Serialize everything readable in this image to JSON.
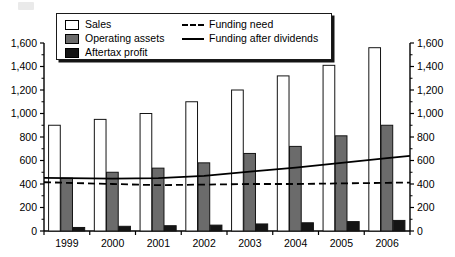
{
  "chart_data": {
    "type": "bar",
    "title": "",
    "xlabel": "",
    "ylabel": "",
    "ylim": [
      0,
      1600
    ],
    "y_ticks": [
      0,
      200,
      400,
      600,
      800,
      1000,
      1200,
      1400,
      1600
    ],
    "y_tick_labels": [
      "0",
      "200",
      "400",
      "600",
      "800",
      "1,000",
      "1,200",
      "1,400",
      "1,600"
    ],
    "dual_axis": true,
    "right_axis_same_as_left": true,
    "grid": false,
    "legend_position": "top-center",
    "categories": [
      "1999",
      "2000",
      "2001",
      "2002",
      "2003",
      "2004",
      "2005",
      "2006"
    ],
    "series": [
      {
        "name": "Sales",
        "kind": "bar",
        "color": "#ffffff",
        "values": [
          900,
          950,
          1000,
          1100,
          1200,
          1320,
          1410,
          1560
        ]
      },
      {
        "name": "Operating assets",
        "kind": "bar",
        "color": "#6b6b6b",
        "values": [
          450,
          500,
          535,
          580,
          660,
          720,
          810,
          900
        ]
      },
      {
        "name": "Aftertax profit",
        "kind": "bar",
        "color": "#141414",
        "values": [
          30,
          40,
          45,
          50,
          60,
          70,
          80,
          90
        ]
      },
      {
        "name": "Funding need",
        "kind": "line",
        "style": "dashed",
        "color": "#000000",
        "values": [
          410,
          400,
          390,
          395,
          400,
          400,
          405,
          410
        ]
      },
      {
        "name": "Funding after dividends",
        "kind": "line",
        "style": "solid",
        "color": "#000000",
        "values": [
          450,
          445,
          450,
          470,
          505,
          540,
          580,
          620
        ]
      }
    ]
  },
  "legend": {
    "items_bars": [
      {
        "label": "Sales",
        "swatch": "swatch-sales",
        "icon": "legend-swatch-white"
      },
      {
        "label": "Operating assets",
        "swatch": "swatch-assets",
        "icon": "legend-swatch-gray"
      },
      {
        "label": "Aftertax profit",
        "swatch": "swatch-profit",
        "icon": "legend-swatch-black"
      }
    ],
    "items_lines": [
      {
        "label": "Funding need",
        "style": "dashed",
        "icon": "legend-line-dashed"
      },
      {
        "label": "Funding after dividends",
        "style": "solid",
        "icon": "legend-line-solid"
      }
    ]
  },
  "colors": {
    "sales": "#ffffff",
    "operating_assets": "#6b6b6b",
    "aftertax_profit": "#141414",
    "axis": "#000000",
    "line": "#000000"
  }
}
